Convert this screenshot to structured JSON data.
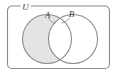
{
  "diagram": {
    "type": "venn-diagram",
    "title": "",
    "universe": {
      "label": "U",
      "shape": "rounded-rectangle",
      "stroke_color": "#8c8c8c"
    },
    "sets": [
      {
        "id": "A",
        "label": "A",
        "position": "left",
        "shaded": true,
        "fill_color": "#e4e4e4",
        "stroke_color": "#8c8c8c"
      },
      {
        "id": "B",
        "label": "B",
        "position": "right",
        "shaded": false,
        "fill_color": "#ffffff",
        "stroke_color": "#8c8c8c"
      }
    ],
    "shaded_region": {
      "description": "A minus B",
      "notation": "A \\ B",
      "fill_color": "#e4e4e4"
    },
    "intersection": {
      "shaded": false,
      "fill_color": "#ffffff"
    },
    "colors": {
      "stroke": "#8c8c8c",
      "shade": "#e4e4e4",
      "label": "#3d3d3d",
      "background": "#ffffff"
    }
  }
}
